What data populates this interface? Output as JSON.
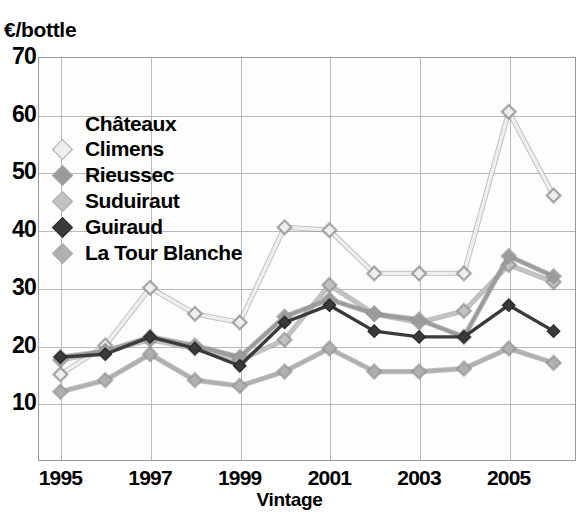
{
  "y_axis": {
    "unit_label": "€/bottle",
    "ticks": [
      "70",
      "60",
      "50",
      "40",
      "30",
      "20",
      "10"
    ]
  },
  "x_axis": {
    "title": "Vintage",
    "ticks": [
      "1995",
      "1997",
      "1999",
      "2001",
      "2003",
      "2005"
    ]
  },
  "legend": {
    "title": "Châteaux",
    "items": [
      {
        "label": "Climens",
        "color": "#eeeeee"
      },
      {
        "label": "Rieussec",
        "color": "#9b9b9b"
      },
      {
        "label": "Suduiraut",
        "color": "#c2c2c2"
      },
      {
        "label": "Guiraud",
        "color": "#3a3a3a"
      },
      {
        "label": "La Tour Blanche",
        "color": "#b0b0b0"
      }
    ]
  },
  "scan_artifact": "",
  "chart_data": {
    "type": "line",
    "title": "",
    "xlabel": "Vintage",
    "ylabel": "€/bottle",
    "xlim": [
      1994.5,
      2006.5
    ],
    "ylim": [
      0,
      70
    ],
    "yticks": [
      10,
      20,
      30,
      40,
      50,
      60,
      70
    ],
    "xticks": [
      1995,
      1997,
      1999,
      2001,
      2003,
      2005
    ],
    "grid": true,
    "legend_position": "upper-left-inside",
    "legend_title": "Châteaux",
    "x": [
      1995,
      1996,
      1997,
      1998,
      1999,
      2000,
      2001,
      2002,
      2003,
      2004,
      2005,
      2006
    ],
    "series": [
      {
        "name": "Climens",
        "color": "#eeeeee",
        "values": [
          15,
          20,
          30,
          25.5,
          24,
          40.5,
          40,
          32.5,
          32.5,
          32.5,
          60.5,
          46
        ]
      },
      {
        "name": "Rieussec",
        "color": "#9b9b9b",
        "values": [
          18,
          19,
          21.5,
          20,
          18,
          25,
          28,
          25.5,
          24.5,
          21.5,
          35.5,
          32
        ]
      },
      {
        "name": "Suduiraut",
        "color": "#c2c2c2",
        "values": [
          17.5,
          19,
          21,
          19.5,
          17.5,
          21,
          30.5,
          25.5,
          24,
          26,
          34,
          31
        ]
      },
      {
        "name": "Guiraud",
        "color": "#3a3a3a",
        "values": [
          18,
          18.5,
          21.5,
          19.5,
          16.5,
          24,
          27,
          22.5,
          21.5,
          21.5,
          27,
          22.5
        ]
      },
      {
        "name": "La Tour Blanche",
        "color": "#b0b0b0",
        "values": [
          12,
          14,
          18.5,
          14,
          13,
          15.5,
          19.5,
          15.5,
          15.5,
          16,
          19.5,
          17
        ]
      }
    ]
  }
}
